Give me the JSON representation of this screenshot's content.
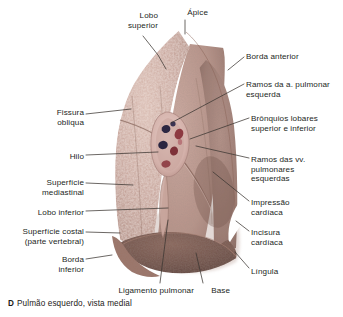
{
  "figure": {
    "title": "Pulmão esquerdo, vista medial",
    "panel_letter": "D",
    "background_color": "#ffffff",
    "leader_line_color": "#3b3632",
    "palette": {
      "lung_light": "#cbaaa0",
      "lung_mid": "#b8938a",
      "lung_shadow": "#8d6a60",
      "base_dark": "#6e4f45",
      "hilum_pale": "#e0c3bd",
      "bronchus_dark": "#2b2740",
      "vessel_red": "#8e3a42",
      "text": "#241f1c"
    }
  },
  "labels": [
    {
      "id": "lobo-superior",
      "text": "Lobo\nsuperior",
      "side": "left",
      "x": 112,
      "y": 11,
      "w": 46
    },
    {
      "id": "apice",
      "text": "Ápice",
      "side": "left",
      "x": 172,
      "y": 8,
      "w": 36
    },
    {
      "id": "borda-anterior",
      "text": "Borda anterior",
      "side": "right",
      "x": 246,
      "y": 52,
      "w": 92
    },
    {
      "id": "ramos-a-pulmonar",
      "text": "Ramos da a. pulmonar\nesquerda",
      "side": "right",
      "x": 246,
      "y": 80,
      "w": 96
    },
    {
      "id": "bronquios-lobares",
      "text": "Brônquios lobares\nsuperior e inferior",
      "side": "right",
      "x": 251,
      "y": 114,
      "w": 92
    },
    {
      "id": "ramos-vv-pulmonares",
      "text": "Ramos das vv.\npulmonares\nesquerdas",
      "side": "right",
      "x": 251,
      "y": 155,
      "w": 90
    },
    {
      "id": "impressao-cardiaca",
      "text": "Impressão\ncardíaca",
      "side": "right",
      "x": 251,
      "y": 198,
      "w": 84
    },
    {
      "id": "incisura-cardiaca",
      "text": "Incisura\ncardíaca",
      "side": "right",
      "x": 251,
      "y": 228,
      "w": 84
    },
    {
      "id": "lingula",
      "text": "Língula",
      "side": "right",
      "x": 251,
      "y": 267,
      "w": 84
    },
    {
      "id": "fissura-obliqua",
      "text": "Fissura\nobliqua",
      "side": "left",
      "x": 22,
      "y": 108,
      "w": 62
    },
    {
      "id": "hilo",
      "text": "Hilo",
      "side": "left",
      "x": 40,
      "y": 152,
      "w": 44
    },
    {
      "id": "superficie-mediastinal",
      "text": "Superfície\nmediastinal",
      "side": "left",
      "x": 14,
      "y": 178,
      "w": 70
    },
    {
      "id": "lobo-inferior",
      "text": "Lobo inferior",
      "side": "left",
      "x": 8,
      "y": 208,
      "w": 76
    },
    {
      "id": "superficie-costal",
      "text": "Superfície costal\n(parte vertebral)",
      "side": "left",
      "x": 3,
      "y": 227,
      "w": 81
    },
    {
      "id": "borda-inferior",
      "text": "Borda\ninferior",
      "side": "left",
      "x": 22,
      "y": 255,
      "w": 62
    },
    {
      "id": "ligamento-pulmonar",
      "text": "Ligamento pulmonar",
      "side": "left",
      "x": 98,
      "y": 286,
      "w": 96
    },
    {
      "id": "base",
      "text": "Base",
      "side": "left",
      "x": 196,
      "y": 286,
      "w": 34
    }
  ],
  "leaders": [
    {
      "id": "leader-lobo-superior",
      "d": "M 143,36 L 158,55 L 166,69"
    },
    {
      "id": "leader-apice",
      "d": "M 185,20 L 185,34"
    },
    {
      "id": "leader-borda-anterior",
      "d": "M 244,57 L 228,70"
    },
    {
      "id": "leader-ramos-a-pulmonar",
      "d": "M 244,84 L 171,123"
    },
    {
      "id": "leader-bronquios",
      "d": "M 249,118 L 190,139"
    },
    {
      "id": "leader-ramos-vv",
      "d": "M 249,158 L 196,146"
    },
    {
      "id": "leader-impressao",
      "d": "M 249,201 L 213,172"
    },
    {
      "id": "leader-incisura",
      "d": "M 249,231 L 236,221"
    },
    {
      "id": "leader-lingula",
      "d": "M 249,268 L 235,252"
    },
    {
      "id": "leader-fissura",
      "d": "M 86,114 L 131,109"
    },
    {
      "id": "leader-hilo",
      "d": "M 86,155 L 158,152"
    },
    {
      "id": "leader-superficie-mediastinal",
      "d": "M 86,183 L 133,185"
    },
    {
      "id": "leader-lobo-inferior",
      "d": "M 86,211 L 168,208"
    },
    {
      "id": "leader-superficie-costal",
      "d": "M 86,232 L 120,233"
    },
    {
      "id": "leader-borda-inferior",
      "d": "M 86,259 L 112,255"
    },
    {
      "id": "leader-ligamento",
      "d": "M 160,283 L 168,220"
    },
    {
      "id": "leader-base",
      "d": "M 203,283 L 196,253"
    }
  ],
  "hilum_structures": [
    {
      "id": "bronchus-superior",
      "kind": "bronchus",
      "cx": 166,
      "cy": 129,
      "rx": 4.4,
      "ry": 4.0,
      "rot": -18,
      "color": "#2c2742"
    },
    {
      "id": "bronchus-inferior",
      "kind": "bronchus",
      "cx": 163,
      "cy": 145,
      "rx": 4.8,
      "ry": 4.2,
      "rot": -12,
      "color": "#2a2540"
    },
    {
      "id": "bronchus-small",
      "kind": "bronchus",
      "cx": 173,
      "cy": 124,
      "rx": 2.6,
      "ry": 2.4,
      "rot": 0,
      "color": "#3a3352"
    },
    {
      "id": "vein-superior",
      "kind": "vein",
      "cx": 179,
      "cy": 134,
      "rx": 4.2,
      "ry": 5.4,
      "rot": 22,
      "color": "#8d3a41"
    },
    {
      "id": "vein-inferior",
      "kind": "vein",
      "cx": 174,
      "cy": 151,
      "rx": 4.0,
      "ry": 4.6,
      "rot": 14,
      "color": "#7e3139"
    },
    {
      "id": "vein-lower",
      "kind": "vein",
      "cx": 166,
      "cy": 164,
      "rx": 4.6,
      "ry": 3.6,
      "rot": -8,
      "color": "#93454b"
    }
  ]
}
